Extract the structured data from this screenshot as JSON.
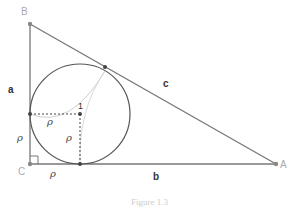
{
  "diagram": {
    "vertices": {
      "A": "A",
      "B": "B",
      "C": "C"
    },
    "sides": {
      "a": "a",
      "b": "b",
      "c": "c"
    },
    "rho": "ρ",
    "center_label": "1",
    "caption": "Figure 1.3",
    "colors": {
      "line": "#777777",
      "circle": "#555555",
      "dashed": "#444444",
      "thin_curve": "#cccccc",
      "vertex_label": "#aaaaaa"
    }
  }
}
